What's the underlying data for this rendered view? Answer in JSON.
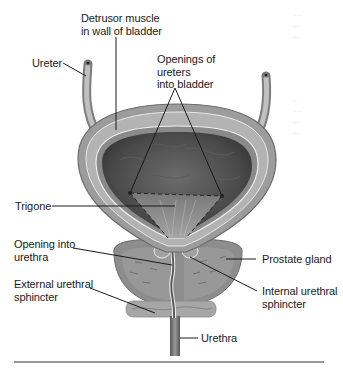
{
  "figure": {
    "labels": {
      "detrusor": "Detrusor muscle\nin wall of bladder",
      "ureter": "Ureter",
      "openings": "Openings of\nureters\ninto bladder",
      "trigone": "Trigone",
      "opening_urethra": "Opening into\nurethra",
      "prostate": "Prostate gland",
      "external_sphincter": "External urethral\nsphincter",
      "internal_sphincter": "Internal urethral\nsphincter",
      "urethra": "Urethra"
    },
    "bleed_through": [
      "∙∙∙∙\n∙∙∙\n∙∙∙",
      "∙∙∙\n∙∙∙∙\n∙∙∙\n∙∙∙"
    ],
    "colors": {
      "wall_outer": "#9a9a9a",
      "wall_inner": "#b8b8b8",
      "lumen": "#4a4a4a",
      "trigone": "#8e8e8e",
      "prostate": "#8f8f8f",
      "sphincter": "#a8a8a8",
      "leader": "#1a1a1a",
      "rule": "#333333"
    }
  }
}
